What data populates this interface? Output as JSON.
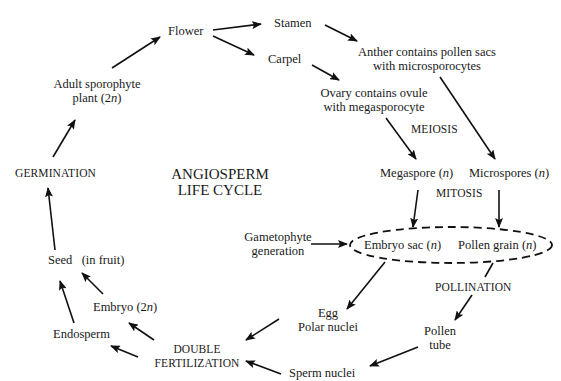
{
  "diagram": {
    "title_line1": "ANGIOSPERM",
    "title_line2": "LIFE CYCLE",
    "nodes": {
      "flower": "Flower",
      "stamen": "Stamen",
      "carpel": "Carpel",
      "anther_line1": "Anther contains pollen sacs",
      "anther_line2": "with microsporocytes",
      "ovary_line1": "Ovary contains ovule",
      "ovary_line2": "with megasporocyte",
      "meiosis": "MEIOSIS",
      "megaspore": "Megaspore (",
      "microspores": "Microspores (",
      "n": "n",
      "close_paren": ")",
      "mitosis": "MITOSIS",
      "gametophyte_line1": "Gametophyte",
      "gametophyte_line2": "generation",
      "embryo_sac": "Embryo sac (",
      "pollen_grain": "Pollen grain (",
      "pollination": "POLLINATION",
      "egg": "Egg",
      "polar_nuclei": "Polar nuclei",
      "pollen_line1": "Pollen",
      "pollen_line2": "tube",
      "sperm_nuclei": "Sperm nuclei",
      "double_line1": "DOUBLE",
      "double_line2": "FERTILIZATION",
      "endosperm": "Endosperm",
      "embryo": "Embryo (2",
      "seed": "Seed   (in fruit)",
      "germination": "GERMINATION",
      "adult_line1": "Adult sporophyte",
      "adult_line2": "plant (2"
    },
    "arrow_color": "#111111"
  }
}
